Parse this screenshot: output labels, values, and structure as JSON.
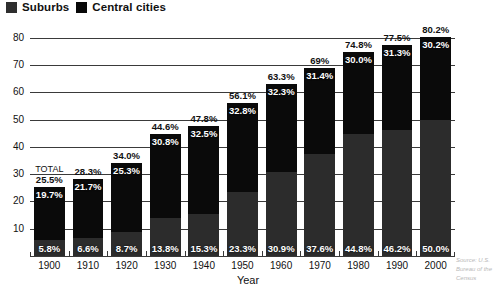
{
  "legend": {
    "items": [
      {
        "label": "Suburbs",
        "color": "#2e2e2e",
        "swatch_icon": "square-swatch-icon"
      },
      {
        "label": "Central cities",
        "color": "#080808",
        "swatch_icon": "square-swatch-icon"
      }
    ]
  },
  "axes": {
    "x_title": "Year",
    "y_ticks": [
      "10",
      "20",
      "30",
      "40",
      "50",
      "60",
      "70",
      "80"
    ],
    "x_ticks": [
      "1900",
      "1910",
      "1920",
      "1930",
      "1940",
      "1950",
      "1960",
      "1970",
      "1980",
      "1990",
      "2000"
    ]
  },
  "annotations": {
    "total_word": "TOTAL"
  },
  "source": {
    "text": "Source: U.S. Bureau of the Census"
  },
  "chart_data": {
    "type": "bar",
    "subtype": "stacked-bar",
    "title": "",
    "xlabel": "Year",
    "ylabel": "",
    "ylim": [
      0,
      85
    ],
    "grid": true,
    "legend_position": "top-left",
    "categories": [
      "1900",
      "1910",
      "1920",
      "1930",
      "1940",
      "1950",
      "1960",
      "1970",
      "1980",
      "1990",
      "2000"
    ],
    "series": [
      {
        "name": "Suburbs",
        "color": "#2c2c2c",
        "values": [
          5.8,
          6.6,
          8.7,
          13.8,
          15.3,
          23.3,
          30.9,
          37.6,
          44.8,
          46.2,
          50.0
        ],
        "labels": [
          "5.8%",
          "6.6%",
          "8.7%",
          "13.8%",
          "15.3%",
          "23.3%",
          "30.9%",
          "37.6%",
          "44.8%",
          "46.2%",
          "50.0%"
        ]
      },
      {
        "name": "Central cities",
        "color": "#0a0a0a",
        "values": [
          19.7,
          21.7,
          25.3,
          30.8,
          32.5,
          32.8,
          32.3,
          31.4,
          30.0,
          31.3,
          30.2
        ],
        "labels": [
          "19.7%",
          "21.7%",
          "25.3%",
          "30.8%",
          "32.5%",
          "32.8%",
          "32.3%",
          "31.4%",
          "30.0%",
          "31.3%",
          "30.2%"
        ]
      }
    ],
    "totals": [
      25.5,
      28.3,
      34.0,
      44.6,
      47.8,
      56.1,
      63.3,
      69.0,
      74.8,
      77.5,
      80.2
    ],
    "total_labels": [
      "25.5%",
      "28.3%",
      "34.0%",
      "44.6%",
      "47.8%",
      "56.1%",
      "63.3%",
      "69%",
      "74.8%",
      "77.5%",
      "80.2%"
    ]
  }
}
